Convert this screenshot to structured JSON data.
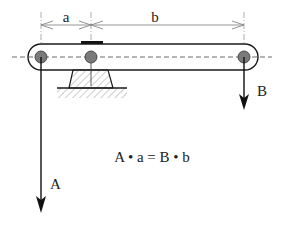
{
  "diagram": {
    "dimensions": {
      "a_label": "a",
      "b_label": "b"
    },
    "forces": {
      "A_label": "A",
      "B_label": "B"
    },
    "equation": "A • a = B • b",
    "colors": {
      "line": "#1a1a1a",
      "pivot_fill": "#7a7a7a",
      "dim_line": "#888888",
      "hatch": "#999999",
      "background": "#ffffff"
    }
  }
}
